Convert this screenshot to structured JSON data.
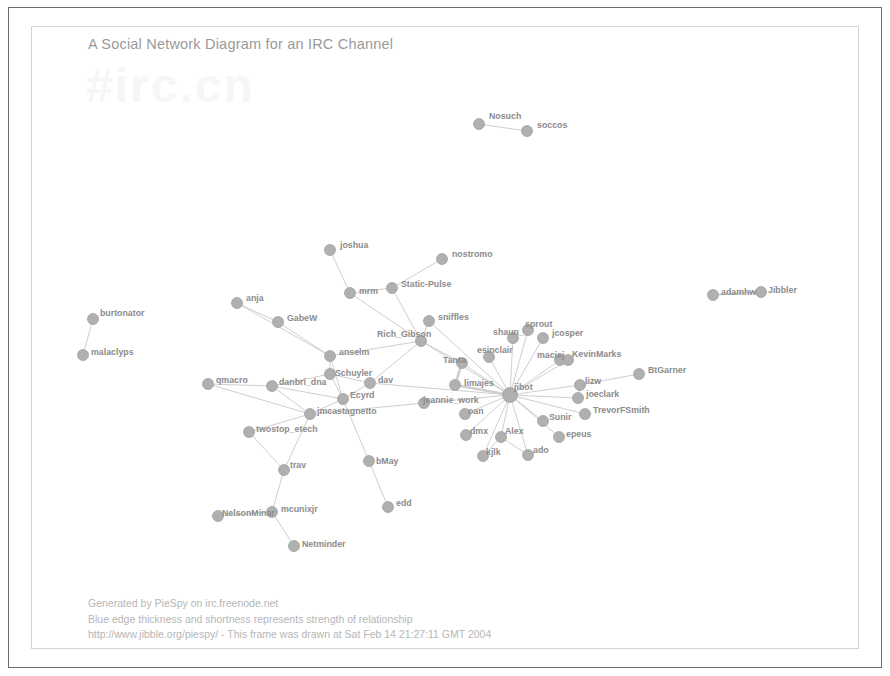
{
  "window": {
    "frame_color": "#6e6e6e",
    "inner_frame_color": "#d3d3d3",
    "background": "#ffffff"
  },
  "diagram": {
    "title": "A Social Network Diagram for an IRC Channel",
    "watermark": "#irc.cn",
    "node_color": "#b0b0b0",
    "node_stroke": "#9a9a9a",
    "edge_color": "#cfcfcf",
    "label_color": "#8c8c8c",
    "title_color": "#9a9a9a"
  },
  "footer": {
    "line1": "Generated by PieSpy on irc.freenode.net",
    "line2": "Blue edge thickness and shortness represents strength of relationship",
    "line3": "http://www.jibble.org/piespy/ - This frame was drawn at Sat Feb 14 21:27:11 GMT 2004"
  },
  "chart_data": {
    "type": "diagram",
    "layout": "force-directed-social-network",
    "title": "A Social Network Diagram for an IRC Channel",
    "node_count": 56,
    "edge_count": 74,
    "hub": "jibot",
    "nodes": [
      {
        "id": "Nosuch",
        "label": "Nosuch",
        "x": 479,
        "y": 124,
        "r": 5.5,
        "lx": 489,
        "ly": 112
      },
      {
        "id": "soccos",
        "label": "soccos",
        "x": 527,
        "y": 131,
        "r": 5.5,
        "lx": 537,
        "ly": 121
      },
      {
        "id": "joshua",
        "label": "joshua",
        "x": 330,
        "y": 250,
        "r": 5.5,
        "lx": 340,
        "ly": 241
      },
      {
        "id": "nostromo",
        "label": "nostromo",
        "x": 442,
        "y": 259,
        "r": 5.5,
        "lx": 452,
        "ly": 250
      },
      {
        "id": "mrm",
        "label": "mrm",
        "x": 350,
        "y": 293,
        "r": 5.5,
        "lx": 359,
        "ly": 287
      },
      {
        "id": "Static-Pulse",
        "label": "Static-Pulse",
        "x": 392,
        "y": 288,
        "r": 5.5,
        "lx": 401,
        "ly": 280
      },
      {
        "id": "anja",
        "label": "anja",
        "x": 237,
        "y": 303,
        "r": 5.5,
        "lx": 246,
        "ly": 294
      },
      {
        "id": "GabeW",
        "label": "GabeW",
        "x": 278,
        "y": 322,
        "r": 5.5,
        "lx": 287,
        "ly": 314
      },
      {
        "id": "burtonator",
        "label": "burtonator",
        "x": 93,
        "y": 319,
        "r": 5.5,
        "lx": 100,
        "ly": 309
      },
      {
        "id": "malaclyps",
        "label": "malaclyps",
        "x": 83,
        "y": 355,
        "r": 5.5,
        "lx": 91,
        "ly": 348
      },
      {
        "id": "adamhw",
        "label": "adamhw",
        "x": 713,
        "y": 295,
        "r": 5.5,
        "lx": 721,
        "ly": 288
      },
      {
        "id": "Jibbler",
        "label": "Jibbler",
        "x": 761,
        "y": 292,
        "r": 5.5,
        "lx": 768,
        "ly": 286
      },
      {
        "id": "sniffles",
        "label": "sniffles",
        "x": 429,
        "y": 321,
        "r": 5.5,
        "lx": 438,
        "ly": 313
      },
      {
        "id": "Rich_Gibson",
        "label": "Rich_Gibson",
        "x": 421,
        "y": 341,
        "r": 5.5,
        "lx": 377,
        "ly": 330
      },
      {
        "id": "anselm",
        "label": "anselm",
        "x": 330,
        "y": 356,
        "r": 5.5,
        "lx": 339,
        "ly": 348
      },
      {
        "id": "shaun_",
        "label": "shaun_",
        "x": 513,
        "y": 338,
        "r": 5.5,
        "lx": 493,
        "ly": 328
      },
      {
        "id": "sprout",
        "label": "sprout",
        "x": 528,
        "y": 330,
        "r": 5.5,
        "lx": 525,
        "ly": 320
      },
      {
        "id": "jcosper",
        "label": "jcosper",
        "x": 543,
        "y": 338,
        "r": 5.5,
        "lx": 552,
        "ly": 329
      },
      {
        "id": "esinclair",
        "label": "esinclair",
        "x": 489,
        "y": 357,
        "r": 5.5,
        "lx": 477,
        "ly": 346
      },
      {
        "id": "maciej",
        "label": "maciej",
        "x": 560,
        "y": 360,
        "r": 5.5,
        "lx": 537,
        "ly": 351
      },
      {
        "id": "KevinMarks",
        "label": "KevinMarks",
        "x": 568,
        "y": 360,
        "r": 5.5,
        "lx": 572,
        "ly": 350
      },
      {
        "id": "Tanta",
        "label": "Tanta",
        "x": 462,
        "y": 363,
        "r": 5.5,
        "lx": 443,
        "ly": 356
      },
      {
        "id": "BtGarner",
        "label": "BtGarner",
        "x": 639,
        "y": 374,
        "r": 5.5,
        "lx": 648,
        "ly": 366
      },
      {
        "id": "lizw",
        "label": "lizw",
        "x": 580,
        "y": 385,
        "r": 5.5,
        "lx": 585,
        "ly": 377
      },
      {
        "id": "qmacro",
        "label": "qmacro",
        "x": 208,
        "y": 384,
        "r": 5.5,
        "lx": 216,
        "ly": 376
      },
      {
        "id": "danbri_dna",
        "label": "danbri_dna",
        "x": 272,
        "y": 386,
        "r": 5.5,
        "lx": 279,
        "ly": 378
      },
      {
        "id": "dav",
        "label": "dav",
        "x": 370,
        "y": 383,
        "r": 5.5,
        "lx": 378,
        "ly": 376
      },
      {
        "id": "Schuyler",
        "label": "Schuyler",
        "x": 330,
        "y": 374,
        "r": 5.5,
        "lx": 335,
        "ly": 369
      },
      {
        "id": "limajes",
        "label": "limajes",
        "x": 455,
        "y": 385,
        "r": 5.5,
        "lx": 464,
        "ly": 379
      },
      {
        "id": "jibot",
        "label": "jibot",
        "x": 510,
        "y": 395,
        "r": 7.5,
        "lx": 514,
        "ly": 383
      },
      {
        "id": "joeclark",
        "label": "joeclark",
        "x": 578,
        "y": 398,
        "r": 5.5,
        "lx": 586,
        "ly": 390
      },
      {
        "id": "Ecyrd",
        "label": "Ecyrd",
        "x": 343,
        "y": 399,
        "r": 5.5,
        "lx": 350,
        "ly": 391
      },
      {
        "id": "jeannie_work",
        "label": "jeannie_work",
        "x": 424,
        "y": 403,
        "r": 5.5,
        "lx": 423,
        "ly": 396
      },
      {
        "id": "oan",
        "label": "oan",
        "x": 465,
        "y": 414,
        "r": 5.5,
        "lx": 468,
        "ly": 407
      },
      {
        "id": "jmcastagnetto",
        "label": "jmcastagnetto",
        "x": 310,
        "y": 414,
        "r": 5.5,
        "lx": 317,
        "ly": 407
      },
      {
        "id": "TrevorFSmith",
        "label": "TrevorFSmith",
        "x": 585,
        "y": 414,
        "r": 5.5,
        "lx": 593,
        "ly": 406
      },
      {
        "id": "Sunir",
        "label": "Sunir",
        "x": 543,
        "y": 421,
        "r": 5.5,
        "lx": 549,
        "ly": 413
      },
      {
        "id": "epeus",
        "label": "epeus",
        "x": 559,
        "y": 437,
        "r": 5.5,
        "lx": 566,
        "ly": 430
      },
      {
        "id": "Alex",
        "label": "Alex",
        "x": 501,
        "y": 437,
        "r": 5.5,
        "lx": 505,
        "ly": 427
      },
      {
        "id": "dmx",
        "label": "dmx",
        "x": 466,
        "y": 435,
        "r": 5.5,
        "lx": 470,
        "ly": 427
      },
      {
        "id": "twostop_etech",
        "label": "twostop_etech",
        "x": 249,
        "y": 432,
        "r": 5.5,
        "lx": 256,
        "ly": 425
      },
      {
        "id": "kjlk",
        "label": "kjlk",
        "x": 483,
        "y": 456,
        "r": 5.5,
        "lx": 486,
        "ly": 448
      },
      {
        "id": "ado",
        "label": "ado",
        "x": 528,
        "y": 455,
        "r": 5.5,
        "lx": 533,
        "ly": 446
      },
      {
        "id": "bMay",
        "label": "bMay",
        "x": 369,
        "y": 461,
        "r": 5.5,
        "lx": 376,
        "ly": 457
      },
      {
        "id": "trav",
        "label": "trav",
        "x": 284,
        "y": 470,
        "r": 5.5,
        "lx": 290,
        "ly": 461
      },
      {
        "id": "edd",
        "label": "edd",
        "x": 388,
        "y": 507,
        "r": 5.5,
        "lx": 396,
        "ly": 499
      },
      {
        "id": "mcunixjr",
        "label": "mcunixjr",
        "x": 272,
        "y": 512,
        "r": 5.5,
        "lx": 281,
        "ly": 505
      },
      {
        "id": "NelsonMinar",
        "label": "NelsonMinar",
        "x": 218,
        "y": 516,
        "r": 5.5,
        "lx": 222,
        "ly": 509
      },
      {
        "id": "Netminder",
        "label": "Netminder",
        "x": 294,
        "y": 546,
        "r": 5.5,
        "lx": 302,
        "ly": 540
      }
    ],
    "edges": [
      {
        "source": "Nosuch",
        "target": "soccos",
        "w": 1.0
      },
      {
        "source": "burtonator",
        "target": "malaclyps",
        "w": 1.0
      },
      {
        "source": "adamhw",
        "target": "Jibbler",
        "w": 1.6
      },
      {
        "source": "joshua",
        "target": "mrm",
        "w": 1.0
      },
      {
        "source": "mrm",
        "target": "Static-Pulse",
        "w": 1.0
      },
      {
        "source": "mrm",
        "target": "Rich_Gibson",
        "w": 1.0
      },
      {
        "source": "Static-Pulse",
        "target": "nostromo",
        "w": 1.0
      },
      {
        "source": "Static-Pulse",
        "target": "Rich_Gibson",
        "w": 1.0
      },
      {
        "source": "anja",
        "target": "GabeW",
        "w": 1.0
      },
      {
        "source": "GabeW",
        "target": "anselm",
        "w": 1.0
      },
      {
        "source": "anselm",
        "target": "Schuyler",
        "w": 1.0
      },
      {
        "source": "anselm",
        "target": "Rich_Gibson",
        "w": 1.0
      },
      {
        "source": "anselm",
        "target": "Ecyrd",
        "w": 1.0
      },
      {
        "source": "Schuyler",
        "target": "dav",
        "w": 1.0
      },
      {
        "source": "Schuyler",
        "target": "Ecyrd",
        "w": 1.0
      },
      {
        "source": "danbri_dna",
        "target": "qmacro",
        "w": 1.0
      },
      {
        "source": "danbri_dna",
        "target": "Schuyler",
        "w": 1.0
      },
      {
        "source": "danbri_dna",
        "target": "jmcastagnetto",
        "w": 1.0
      },
      {
        "source": "danbri_dna",
        "target": "Ecyrd",
        "w": 1.0
      },
      {
        "source": "jmcastagnetto",
        "target": "twostop_etech",
        "w": 1.0
      },
      {
        "source": "jmcastagnetto",
        "target": "trav",
        "w": 1.0
      },
      {
        "source": "jmcastagnetto",
        "target": "Ecyrd",
        "w": 1.0
      },
      {
        "source": "jmcastagnetto",
        "target": "jeannie_work",
        "w": 1.0
      },
      {
        "source": "Ecyrd",
        "target": "dav",
        "w": 1.0
      },
      {
        "source": "Ecyrd",
        "target": "bMay",
        "w": 1.0
      },
      {
        "source": "dav",
        "target": "Rich_Gibson",
        "w": 1.0
      },
      {
        "source": "dav",
        "target": "jibot",
        "w": 1.0
      },
      {
        "source": "Rich_Gibson",
        "target": "sniffles",
        "w": 1.0
      },
      {
        "source": "Rich_Gibson",
        "target": "Tanta",
        "w": 1.0
      },
      {
        "source": "Rich_Gibson",
        "target": "jibot",
        "w": 1.0
      },
      {
        "source": "Tanta",
        "target": "limajes",
        "w": 2.6
      },
      {
        "source": "limajes",
        "target": "jibot",
        "w": 2.6
      },
      {
        "source": "Tanta",
        "target": "jibot",
        "w": 1.0
      },
      {
        "source": "jeannie_work",
        "target": "jibot",
        "w": 1.0
      },
      {
        "source": "oan",
        "target": "jibot",
        "w": 1.0
      },
      {
        "source": "sniffles",
        "target": "jibot",
        "w": 1.0
      },
      {
        "source": "esinclair",
        "target": "jibot",
        "w": 1.0
      },
      {
        "source": "shaun_",
        "target": "jibot",
        "w": 1.0
      },
      {
        "source": "sprout",
        "target": "jibot",
        "w": 1.0
      },
      {
        "source": "jcosper",
        "target": "jibot",
        "w": 1.0
      },
      {
        "source": "maciej",
        "target": "jibot",
        "w": 1.0
      },
      {
        "source": "KevinMarks",
        "target": "jibot",
        "w": 1.0
      },
      {
        "source": "lizw",
        "target": "jibot",
        "w": 1.0
      },
      {
        "source": "lizw",
        "target": "BtGarner",
        "w": 1.0
      },
      {
        "source": "joeclark",
        "target": "jibot",
        "w": 1.0
      },
      {
        "source": "TrevorFSmith",
        "target": "jibot",
        "w": 1.0
      },
      {
        "source": "Sunir",
        "target": "jibot",
        "w": 1.0
      },
      {
        "source": "epeus",
        "target": "jibot",
        "w": 1.0
      },
      {
        "source": "Alex",
        "target": "jibot",
        "w": 1.0
      },
      {
        "source": "dmx",
        "target": "jibot",
        "w": 1.0
      },
      {
        "source": "kjlk",
        "target": "jibot",
        "w": 1.0
      },
      {
        "source": "ado",
        "target": "jibot",
        "w": 1.0
      },
      {
        "source": "Alex",
        "target": "kjlk",
        "w": 1.0
      },
      {
        "source": "Alex",
        "target": "ado",
        "w": 1.0
      },
      {
        "source": "twostop_etech",
        "target": "trav",
        "w": 1.0
      },
      {
        "source": "trav",
        "target": "mcunixjr",
        "w": 1.0
      },
      {
        "source": "mcunixjr",
        "target": "NelsonMinar",
        "w": 1.0
      },
      {
        "source": "mcunixjr",
        "target": "Netminder",
        "w": 1.0
      },
      {
        "source": "bMay",
        "target": "edd",
        "w": 1.0
      },
      {
        "source": "qmacro",
        "target": "jmcastagnetto",
        "w": 1.0
      },
      {
        "source": "maciej",
        "target": "KevinMarks",
        "w": 1.0
      },
      {
        "source": "joeclark",
        "target": "lizw",
        "w": 1.0
      },
      {
        "source": "anja",
        "target": "anselm",
        "w": 1.0
      }
    ]
  }
}
